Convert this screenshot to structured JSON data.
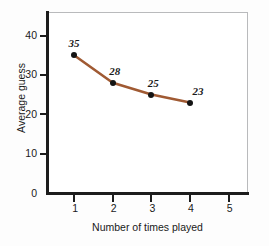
{
  "chart_data": {
    "type": "line",
    "title": "",
    "xlabel": "Number of times played",
    "ylabel": "Average guess",
    "x": [
      1,
      2,
      3,
      4
    ],
    "values": [
      35,
      28,
      25,
      23
    ],
    "point_labels": [
      "35",
      "28",
      "25",
      "23"
    ],
    "xlim": [
      0.3,
      5.5
    ],
    "ylim": [
      0,
      46
    ],
    "xticks": [
      1,
      2,
      3,
      4,
      5
    ],
    "xtick_labels": [
      "1",
      "2",
      "3",
      "4",
      "5"
    ],
    "yticks": [
      0,
      10,
      20,
      30,
      40
    ],
    "ytick_labels": [
      "0",
      "10",
      "20",
      "30",
      "40"
    ],
    "grid": false,
    "legend": "none",
    "series": [
      {
        "name": "Average guess",
        "categories": [
          1,
          2,
          3,
          4
        ],
        "values": [
          35,
          28,
          25,
          23
        ]
      }
    ],
    "colors": {
      "line": "#a05a33",
      "marker": "#141414",
      "axis": "#1c1c1c",
      "frame": "#b9babc",
      "plot_background": "#ffffff",
      "figure_background": "#fdfdfd",
      "text": "#1a1a1a"
    }
  }
}
